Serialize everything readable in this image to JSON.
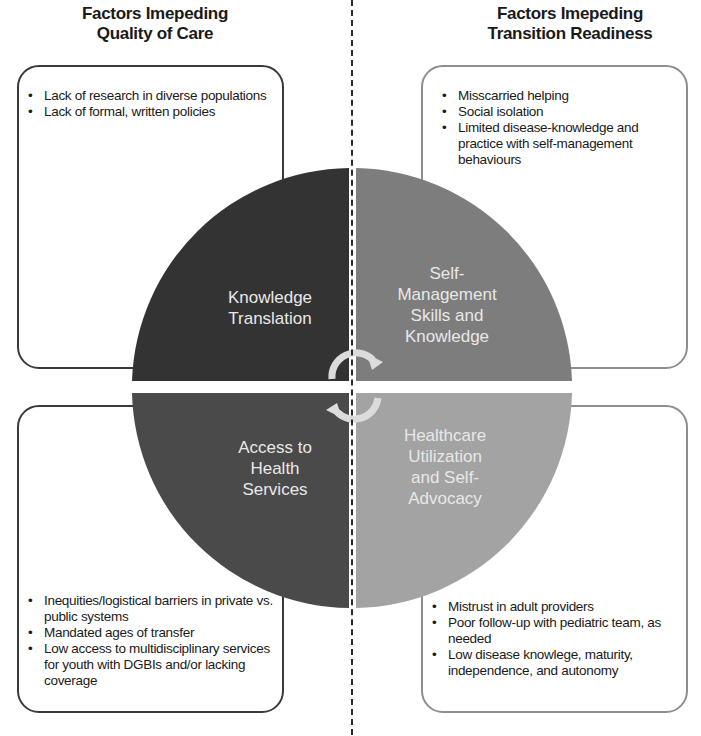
{
  "headings": {
    "left": [
      "Factors Imepeding",
      "Quality of Care"
    ],
    "right": [
      "Factors Imepeding",
      "Transition Readiness"
    ]
  },
  "boxes": {
    "top_left": {
      "items": [
        "Lack of research in diverse populations",
        "Lack of formal, written policies"
      ]
    },
    "top_right": {
      "items": [
        "Misscarried helping",
        "Social isolation",
        "Limited disease-knowledge and practice with self-management behaviours"
      ]
    },
    "bottom_left": {
      "items": [
        "Inequities/logistical barriers in private vs. public systems",
        "Mandated ages of transfer",
        "Low access to multidisciplinary services for youth with DGBIs and/or lacking coverage"
      ]
    },
    "bottom_right": {
      "items": [
        "Mistrust in adult providers",
        "Poor follow-up with pediatric team, as needed",
        "Low disease knowlege, maturity, independence, and autonomy"
      ]
    }
  },
  "quadrants": {
    "top_left": {
      "label": [
        "Knowledge",
        "Translation"
      ],
      "color": "#333333"
    },
    "top_right": {
      "label": [
        "Self-",
        "Management",
        "Skills and",
        "Knowledge"
      ],
      "color": "#7d7d7d"
    },
    "bottom_left": {
      "label": [
        "Access to",
        "Health",
        "Services"
      ],
      "color": "#4a4a4a"
    },
    "bottom_right": {
      "label": [
        "Healthcare",
        "Utilization",
        "and Self-",
        "Advocacy"
      ],
      "color": "#a3a3a3"
    }
  },
  "footer": {
    "partial_text": "... ... ... ... of AACT ... ... with DIB ..."
  }
}
